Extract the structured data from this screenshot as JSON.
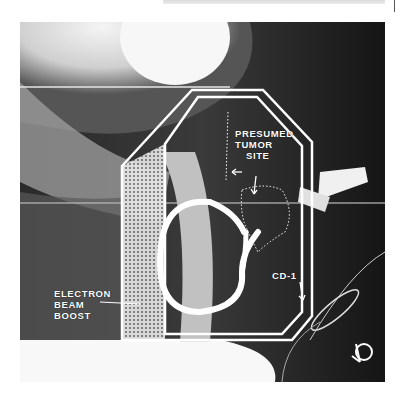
{
  "header": {
    "running_text": ""
  },
  "figure": {
    "type": "lateral radiograph with treatment field outline",
    "labels": {
      "tumor": [
        "PRESUMED",
        "TUMOR",
        "SITE"
      ],
      "electron": [
        "ELECTRON",
        "BEAM",
        "BOOST"
      ],
      "cd": "CD-1"
    },
    "colors": {
      "field_line": "#ffffff",
      "background": "#111111"
    }
  }
}
